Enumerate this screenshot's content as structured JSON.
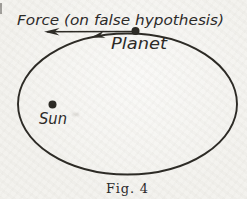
{
  "figure": {
    "force_label": "Force (on false hypothesis)",
    "planet_label": "Planet",
    "sun_label": "Sun",
    "caption": "Fig. 4"
  },
  "colors": {
    "ink": "#26241f",
    "paper": "#f3f2ee"
  }
}
